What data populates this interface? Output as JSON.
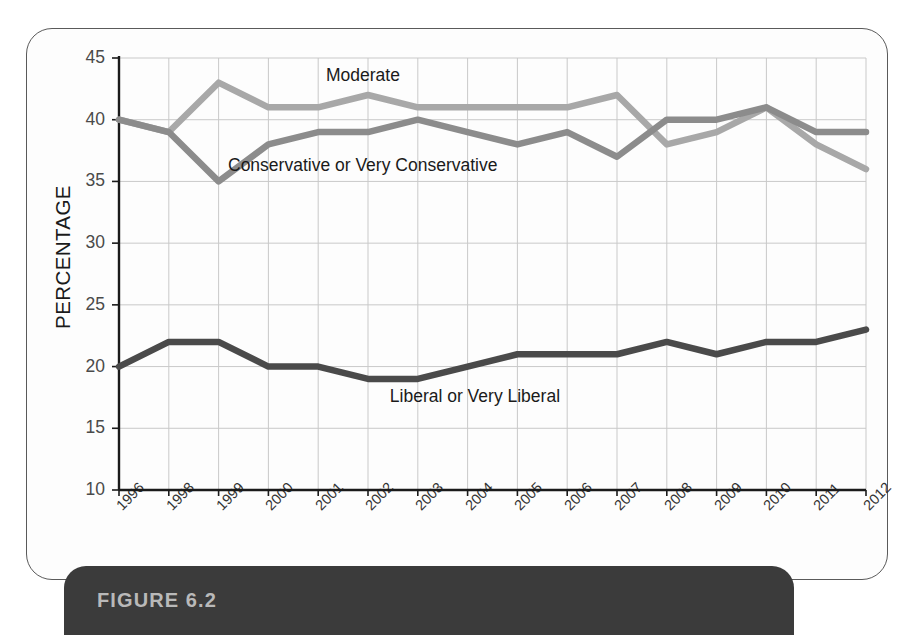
{
  "figure": {
    "label": "FIGURE 6.2"
  },
  "axes": {
    "y_axis_title": "PERCENTAGE",
    "y_ticks": [
      "45",
      "40",
      "35",
      "30",
      "25",
      "20",
      "15",
      "10"
    ],
    "x_ticks": [
      "1996",
      "1998",
      "1999",
      "2000",
      "2001",
      "2002",
      "2003",
      "2004",
      "2005",
      "2006",
      "2007",
      "2008",
      "2009",
      "2010",
      "2011",
      "2012"
    ]
  },
  "series_labels": {
    "moderate": "Moderate",
    "conservative": "Conservative or Very Conservative",
    "liberal": "Liberal or Very Liberal"
  },
  "colors": {
    "moderate": "#a8a8a8",
    "conservative": "#8c8c8c",
    "liberal": "#4a4a4a",
    "grid": "#c9c9c9",
    "axis": "#1a1a1a",
    "banner": "#3b3b3b",
    "banner_text": "#b9b9b9"
  },
  "chart_data": {
    "type": "line",
    "title": "FIGURE 6.2",
    "xlabel": "",
    "ylabel": "PERCENTAGE",
    "x": [
      "1996",
      "1998",
      "1999",
      "2000",
      "2001",
      "2002",
      "2003",
      "2004",
      "2005",
      "2006",
      "2007",
      "2008",
      "2009",
      "2010",
      "2011",
      "2012"
    ],
    "ylim": [
      10,
      45
    ],
    "ytick_step": 5,
    "grid": true,
    "legend": "inline-annotations",
    "series": [
      {
        "name": "Moderate",
        "color": "#a8a8a8",
        "values": [
          40,
          39,
          43,
          41,
          41,
          42,
          41,
          41,
          41,
          41,
          42,
          38,
          39,
          41,
          38,
          36
        ]
      },
      {
        "name": "Conservative or Very Conservative",
        "color": "#8c8c8c",
        "values": [
          40,
          39,
          35,
          38,
          39,
          39,
          40,
          39,
          38,
          39,
          37,
          40,
          40,
          41,
          39,
          39
        ]
      },
      {
        "name": "Liberal or Very Liberal",
        "color": "#4a4a4a",
        "values": [
          20,
          22,
          22,
          20,
          20,
          19,
          19,
          20,
          21,
          21,
          21,
          22,
          21,
          22,
          22,
          23
        ]
      }
    ]
  }
}
